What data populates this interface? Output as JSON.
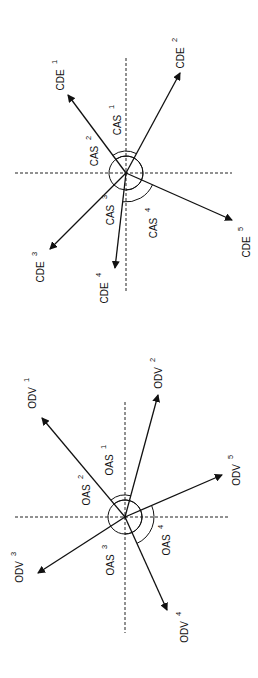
{
  "diagrams": [
    {
      "name": "CDE",
      "center": [
        126,
        173
      ],
      "axes": {
        "v": [
          58,
          292
        ],
        "h": [
          15,
          232
        ]
      },
      "vectors": [
        {
          "label": "CDE",
          "sup": "1",
          "tip": [
            68,
            95
          ],
          "lx": 64,
          "ly": 80
        },
        {
          "label": "CDE",
          "sup": "2",
          "tip": [
            180,
            73
          ],
          "lx": 184,
          "ly": 58
        },
        {
          "label": "CDE",
          "sup": "3",
          "tip": [
            50,
            249
          ],
          "lx": 44,
          "ly": 272
        },
        {
          "label": "CDE",
          "sup": "4",
          "tip": [
            115,
            268
          ],
          "lx": 108,
          "ly": 293
        },
        {
          "label": "CDE",
          "sup": "5",
          "tip": [
            232,
            220
          ],
          "lx": 250,
          "ly": 247
        }
      ],
      "angles": [
        {
          "label": "CAS",
          "sup": "1",
          "lx": 121,
          "ly": 125
        },
        {
          "label": "CAS",
          "sup": "2",
          "lx": 98,
          "ly": 156
        },
        {
          "label": "CAS",
          "sup": "3",
          "lx": 114,
          "ly": 215
        },
        {
          "label": "CAS",
          "sup": "4",
          "lx": 157,
          "ly": 228
        }
      ]
    },
    {
      "name": "ODV",
      "center": [
        125,
        517
      ],
      "axes": {
        "v": [
          402,
          633
        ],
        "h": [
          15,
          230
        ]
      },
      "vectors": [
        {
          "label": "ODV",
          "sup": "1",
          "tip": [
            42,
            418
          ],
          "lx": 36,
          "ly": 398
        },
        {
          "label": "ODV",
          "sup": "2",
          "tip": [
            158,
            395
          ],
          "lx": 162,
          "ly": 378
        },
        {
          "label": "ODV",
          "sup": "3",
          "tip": [
            38,
            573
          ],
          "lx": 23,
          "ly": 572
        },
        {
          "label": "ODV",
          "sup": "4",
          "tip": [
            167,
            610
          ],
          "lx": 188,
          "ly": 632
        },
        {
          "label": "ODV",
          "sup": "5",
          "tip": [
            222,
            475
          ],
          "lx": 240,
          "ly": 475
        }
      ],
      "angles": [
        {
          "label": "OAS",
          "sup": "1",
          "lx": 113,
          "ly": 465
        },
        {
          "label": "OAS",
          "sup": "2",
          "lx": 90,
          "ly": 495
        },
        {
          "label": "OAS",
          "sup": "3",
          "lx": 114,
          "ly": 565
        },
        {
          "label": "OAS",
          "sup": "4",
          "lx": 170,
          "ly": 545
        }
      ]
    }
  ]
}
